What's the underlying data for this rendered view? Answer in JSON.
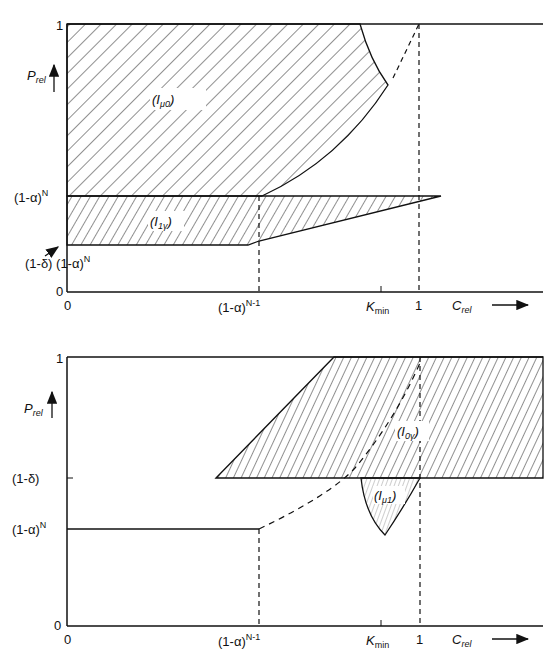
{
  "figures": [
    {
      "id": "top",
      "y_label": "P",
      "y_label_sub": "rel",
      "x_label": "C",
      "x_label_sub": "rel",
      "y_ticks": [
        "1",
        "(1-α)",
        "(1-δ) (1-α)",
        "0"
      ],
      "y_tick_sup": "N",
      "x_ticks": [
        "0",
        "(1-α)",
        "K",
        "1"
      ],
      "x_tick_sup": "N-1",
      "kmin_sub": "min",
      "regions": [
        {
          "name": "I",
          "sub": "μ0"
        },
        {
          "name": "I",
          "sub": "1γ"
        }
      ]
    },
    {
      "id": "bottom",
      "y_label": "P",
      "y_label_sub": "rel",
      "x_label": "C",
      "x_label_sub": "rel",
      "y_ticks": [
        "1",
        "(1-δ)",
        "(1-α)",
        "0"
      ],
      "y_tick_sup": "N",
      "x_ticks": [
        "0",
        "(1-α)",
        "K",
        "1"
      ],
      "x_tick_sup": "N-1",
      "kmin_sub": "min",
      "regions": [
        {
          "name": "I",
          "sub": "0γ"
        },
        {
          "name": "I",
          "sub": "μ1"
        }
      ]
    }
  ]
}
